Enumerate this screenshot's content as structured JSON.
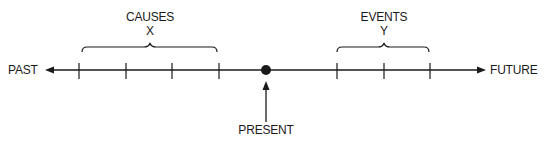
{
  "labels": {
    "past": "PAST",
    "future": "FUTURE",
    "present": "PRESENT",
    "causes_title": "CAUSES",
    "causes_var": "X",
    "events_title": "EVENTS",
    "events_var": "Y"
  },
  "timeline": {
    "cause_ticks": 4,
    "event_ticks": 3,
    "present_marker": "filled-dot"
  },
  "colors": {
    "ink": "#1a1a1a",
    "background": "#ffffff"
  }
}
